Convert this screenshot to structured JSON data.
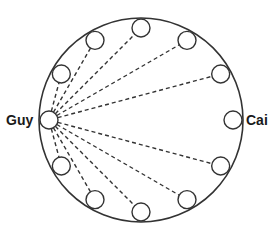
{
  "diagram": {
    "type": "circular seating / connection diagram",
    "outer_circle": {
      "cx": 141,
      "cy": 120,
      "r": 102,
      "stroke": "#333333"
    },
    "node_ring_radius": 92,
    "node_radius": 9,
    "node_angles_deg": [
      180,
      150,
      120,
      90,
      60,
      30,
      0,
      -30,
      -60,
      -90,
      -120,
      -150
    ],
    "labels": {
      "left": "Guy",
      "right": "Cai"
    },
    "source_node_index": 0,
    "target_node_index": 6,
    "connections_from_source_to": [
      1,
      2,
      3,
      4,
      5,
      7,
      8,
      9,
      10,
      11
    ],
    "edge_style": "dashed",
    "line_color": "#333333"
  }
}
